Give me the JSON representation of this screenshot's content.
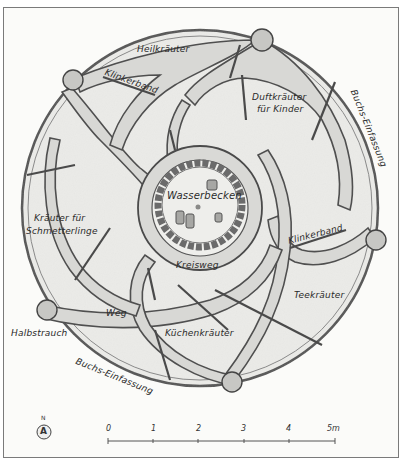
{
  "diagram": {
    "type": "garden-plan",
    "shape": "circular spiral herb garden",
    "beds": {
      "heilkraeuter": "Heilkräuter",
      "duftkraeuter_line1": "Duftkräuter",
      "duftkraeuter_line2": "für Kinder",
      "schmetterlinge_line1": "Kräuter für",
      "schmetterlinge_line2": "Schmetterlinge",
      "teekraeuter": "Teekräuter",
      "kuechenkraeuter": "Küchenkräuter"
    },
    "features": {
      "wasserbecken": "Wasserbecken",
      "kreisweg": "Kreisweg",
      "weg": "Weg",
      "klinkerband_1": "Klinkerband",
      "klinkerband_2": "Klinkerband",
      "buchs_einfassung_1": "Buchs-Einfassung",
      "buchs_einfassung_2": "Buchs-Einfassung",
      "halbstrauch": "Halbstrauch"
    },
    "north_arrow": {
      "label": "N",
      "glyph": "A"
    },
    "scale_bar": {
      "ticks": [
        "0",
        "1",
        "2",
        "3",
        "4",
        "5m"
      ]
    },
    "colors": {
      "background": "#fbfbf9",
      "bed_fill": "#ececea",
      "path_fill": "#d6d6d3",
      "outline": "#4a4a4a",
      "text": "#2a2a2a"
    }
  }
}
